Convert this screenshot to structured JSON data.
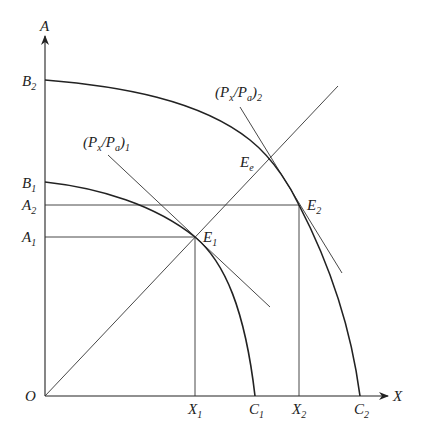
{
  "diagram": {
    "type": "production-possibility-frontier",
    "axes": {
      "y_label": "A",
      "x_label": "X",
      "origin_label": "O"
    },
    "y_ticks": [
      {
        "id": "B2",
        "main": "B",
        "sub": "2"
      },
      {
        "id": "B1",
        "main": "B",
        "sub": "1"
      },
      {
        "id": "A2",
        "main": "A",
        "sub": "2"
      },
      {
        "id": "A1",
        "main": "A",
        "sub": "1"
      }
    ],
    "x_ticks": [
      {
        "id": "X1",
        "main": "X",
        "sub": "1"
      },
      {
        "id": "C1",
        "main": "C",
        "sub": "1"
      },
      {
        "id": "X2",
        "main": "X",
        "sub": "2"
      },
      {
        "id": "C2",
        "main": "C",
        "sub": "2"
      }
    ],
    "points": [
      {
        "id": "E1",
        "main": "E",
        "sub": "1"
      },
      {
        "id": "E2",
        "main": "E",
        "sub": "2"
      },
      {
        "id": "Ee",
        "main": "E",
        "sub": "e"
      }
    ],
    "price_lines": [
      {
        "id": "price1",
        "open": "(P",
        "x_sub": "x",
        "slash": "/P",
        "a_sub": "a",
        "close": ")",
        "sub": "1"
      },
      {
        "id": "price2",
        "open": "(P",
        "x_sub": "x",
        "slash": "/P",
        "a_sub": "a",
        "close": ")",
        "sub": "2"
      }
    ],
    "curves": [
      {
        "id": "ppf1",
        "from": "B1",
        "to": "C1",
        "tangent_point": "E1"
      },
      {
        "id": "ppf2",
        "from": "B2",
        "to": "C2",
        "tangent_point": "E2"
      }
    ],
    "ray": {
      "from": "O",
      "through": [
        "E1",
        "Ee"
      ]
    }
  }
}
